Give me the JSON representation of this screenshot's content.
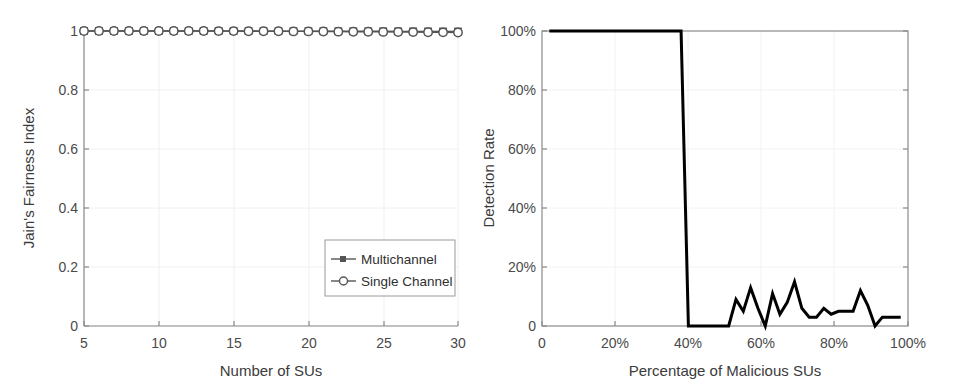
{
  "figure": {
    "background": "#ffffff",
    "panel_count": 2
  },
  "chart_data": [
    {
      "id": "left",
      "type": "line",
      "title": "",
      "xlabel": "Number of SUs",
      "ylabel": "Jain's Fairness Index",
      "xlim": [
        5,
        30
      ],
      "ylim": [
        0,
        1
      ],
      "xticks": [
        5,
        10,
        15,
        20,
        25,
        30
      ],
      "xticklabels": [
        "5",
        "10",
        "15",
        "20",
        "25",
        "30"
      ],
      "yticks": [
        0,
        0.2,
        0.4,
        0.6,
        0.8,
        1
      ],
      "yticklabels": [
        "0",
        "0.2",
        "0.4",
        "0.6",
        "0.8",
        "1"
      ],
      "grid": true,
      "box": false,
      "legend": {
        "position": "lower-right",
        "entries": [
          {
            "name": "Multichannel",
            "marker": "square",
            "color": "#555555"
          },
          {
            "name": "Single Channel",
            "marker": "circle",
            "color": "#555555"
          }
        ]
      },
      "x": [
        5,
        6,
        7,
        8,
        9,
        10,
        11,
        12,
        13,
        14,
        15,
        16,
        17,
        18,
        19,
        20,
        21,
        22,
        23,
        24,
        25,
        26,
        27,
        28,
        29,
        30
      ],
      "series": [
        {
          "name": "Multichannel",
          "marker": "square",
          "color": "#555555",
          "values": [
            1,
            1,
            1,
            1,
            1,
            1,
            1,
            1,
            1,
            1,
            1,
            0.9998,
            0.9997,
            0.9996,
            0.9995,
            0.9994,
            0.9993,
            0.9992,
            0.9991,
            0.999,
            0.9989,
            0.9988,
            0.9987,
            0.9986,
            0.9985,
            0.9984
          ]
        },
        {
          "name": "Single Channel",
          "marker": "circle",
          "color": "#555555",
          "values": [
            1,
            1,
            1,
            1,
            1,
            1,
            1,
            0.9999,
            0.9998,
            0.9997,
            0.9996,
            0.9994,
            0.9992,
            0.999,
            0.9987,
            0.9986,
            0.9984,
            0.9978,
            0.9974,
            0.9973,
            0.997,
            0.9966,
            0.9962,
            0.9958,
            0.9954,
            0.995
          ]
        }
      ]
    },
    {
      "id": "right",
      "type": "line",
      "title": "",
      "xlabel": "Percentage of Malicious SUs",
      "ylabel": "Detection Rate",
      "xlim": [
        0,
        100
      ],
      "ylim": [
        0,
        100
      ],
      "xticks": [
        0,
        20,
        40,
        60,
        80,
        100
      ],
      "xticklabels": [
        "0",
        "20%",
        "40%",
        "60%",
        "80%",
        "100%"
      ],
      "yticks": [
        0,
        20,
        40,
        60,
        80,
        100
      ],
      "yticklabels": [
        "0",
        "20%",
        "40%",
        "60%",
        "80%",
        "100%"
      ],
      "grid": true,
      "box": true,
      "legend": null,
      "series": [
        {
          "name": "Detection Rate",
          "color": "#000000",
          "linewidth": 3,
          "points": [
            [
              2,
              100
            ],
            [
              5,
              100
            ],
            [
              8,
              100
            ],
            [
              11,
              100
            ],
            [
              14,
              100
            ],
            [
              17,
              100
            ],
            [
              20,
              100
            ],
            [
              23,
              100
            ],
            [
              26,
              100
            ],
            [
              29,
              100
            ],
            [
              32,
              100
            ],
            [
              35,
              100
            ],
            [
              38,
              100
            ],
            [
              40,
              0
            ],
            [
              43,
              0
            ],
            [
              46,
              0
            ],
            [
              49,
              0
            ],
            [
              51,
              0
            ],
            [
              53,
              9
            ],
            [
              55,
              5
            ],
            [
              57,
              13
            ],
            [
              59,
              6
            ],
            [
              61,
              0
            ],
            [
              63,
              11
            ],
            [
              65,
              4
            ],
            [
              67,
              8
            ],
            [
              69,
              15
            ],
            [
              71,
              6
            ],
            [
              73,
              3
            ],
            [
              75,
              3
            ],
            [
              77,
              6
            ],
            [
              79,
              4
            ],
            [
              81,
              5
            ],
            [
              83,
              5
            ],
            [
              85,
              5
            ],
            [
              87,
              12
            ],
            [
              89,
              7
            ],
            [
              91,
              0
            ],
            [
              93,
              3
            ],
            [
              96,
              3
            ],
            [
              98,
              3
            ]
          ]
        }
      ]
    }
  ]
}
